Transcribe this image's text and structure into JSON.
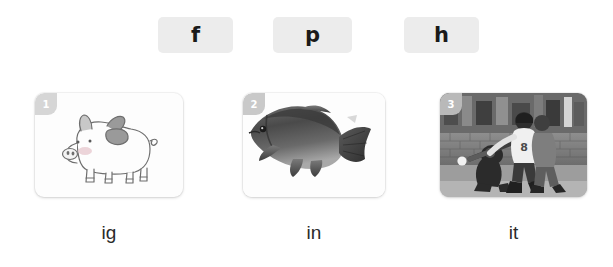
{
  "activity": {
    "type": "phonics-word-building",
    "background_color": "#ffffff"
  },
  "letter_tiles": [
    {
      "letter": "f",
      "tile_color": "#ececec",
      "text_color": "#1a1a1a"
    },
    {
      "letter": "p",
      "tile_color": "#ececec",
      "text_color": "#1a1a1a"
    },
    {
      "letter": "h",
      "tile_color": "#ececec",
      "text_color": "#1a1a1a"
    }
  ],
  "cards": [
    {
      "badge": "1",
      "label": "ig",
      "image_kind": "line-drawing",
      "image_name": "pig-illustration",
      "badge_color": "#d6d6d6"
    },
    {
      "badge": "2",
      "label": "in",
      "image_kind": "photo",
      "image_name": "fish-photo",
      "badge_color": "#c9c9c9"
    },
    {
      "badge": "3",
      "label": "it",
      "image_kind": "photo",
      "image_name": "softball-batter-hit-photo",
      "badge_color": "#b9b9b9"
    }
  ]
}
